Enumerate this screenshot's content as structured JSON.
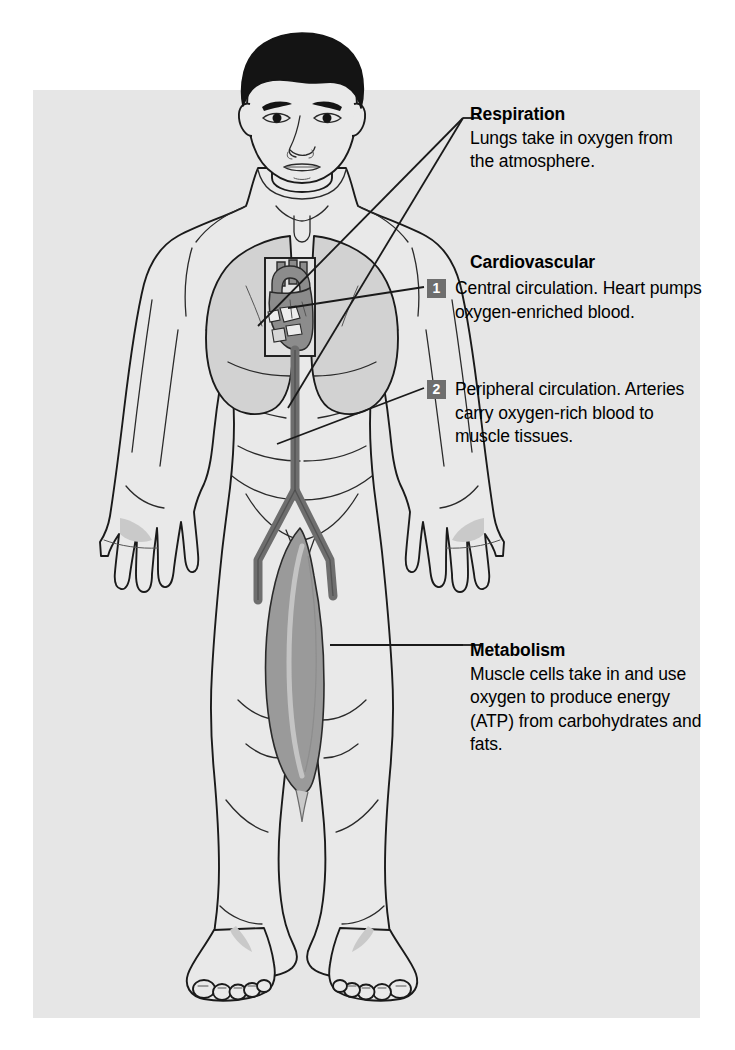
{
  "document": {
    "type": "anatomical-illustration",
    "subject": "Human oxygen transport system"
  },
  "colors": {
    "background": "#ffffff",
    "panel": "#e6e6e6",
    "body_fill": "#e9e9e9",
    "outline": "#1a1a1a",
    "organ_gray": "#8c8c8c",
    "lung_fill": "#d2d2d2",
    "artery": "#6e6e6e",
    "muscle_highlight": "#9a9a9a",
    "badge_bg": "#6e6e6e",
    "badge_text": "#ffffff",
    "hair": "#141414",
    "leader_line": "#1a1a1a"
  },
  "callouts": {
    "respiration": {
      "title": "Respiration",
      "body": "Lungs take in oxygen from the atmosphere."
    },
    "cardiovascular": {
      "title": "Cardiovascular",
      "items": [
        {
          "number": "1",
          "text": "Central circulation. Heart pumps oxygen-enriched blood."
        },
        {
          "number": "2",
          "text": "Peripheral circulation. Arteries carry oxygen-rich blood to muscle tissues."
        }
      ]
    },
    "metabolism": {
      "title": "Metabolism",
      "body": "Muscle cells take in and use oxygen to produce energy (ATP) from carbohydrates and fats."
    }
  },
  "figure": {
    "regions": [
      {
        "name": "head",
        "label": "Head and face"
      },
      {
        "name": "lungs",
        "label": "Lungs"
      },
      {
        "name": "heart",
        "label": "Heart"
      },
      {
        "name": "aorta",
        "label": "Aorta and iliac arteries"
      },
      {
        "name": "quadriceps",
        "label": "Quadriceps muscle group"
      },
      {
        "name": "hands",
        "label": "Hands"
      },
      {
        "name": "feet",
        "label": "Feet"
      }
    ]
  }
}
